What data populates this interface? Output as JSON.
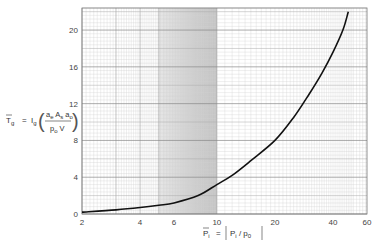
{
  "chart_data": {
    "type": "line",
    "title": "",
    "xlabel": "P̄i = (Pi / p0)",
    "ylabel": "T̄g = Ig (ae As ao / p0 V)",
    "xscale": "log",
    "xlim": [
      2,
      60
    ],
    "ylim": [
      0,
      22.4
    ],
    "x_ticks": [
      2,
      4,
      6,
      10,
      20,
      40,
      60
    ],
    "y_ticks": [
      0,
      4,
      8,
      12,
      16,
      20
    ],
    "grid": true,
    "shaded_region": {
      "x_from": 5,
      "x_to": 10
    },
    "series": [
      {
        "name": "T̄g vs P̄i",
        "x": [
          2,
          3,
          4,
          5,
          6,
          8,
          10,
          12,
          15,
          20,
          25,
          30,
          35,
          40,
          45,
          48
        ],
        "y": [
          0.2,
          0.45,
          0.7,
          0.95,
          1.2,
          2.0,
          3.2,
          4.2,
          5.8,
          8.0,
          10.5,
          13.0,
          15.3,
          17.6,
          20.0,
          22.0
        ]
      }
    ]
  },
  "axes": {
    "y_label_main": "T",
    "y_label_main_sub": "g",
    "y_label_eq": "=",
    "y_label_I": "I",
    "y_label_I_sub": "g",
    "y_frac_num": "a  A  a",
    "y_frac_den": "p  V",
    "x_label_main": "P",
    "x_label_main_sub": "i",
    "x_label_eq": "=",
    "x_label_num": "P",
    "x_label_num_sub": "i",
    "x_label_den": "p",
    "x_label_den_sub": "0"
  }
}
